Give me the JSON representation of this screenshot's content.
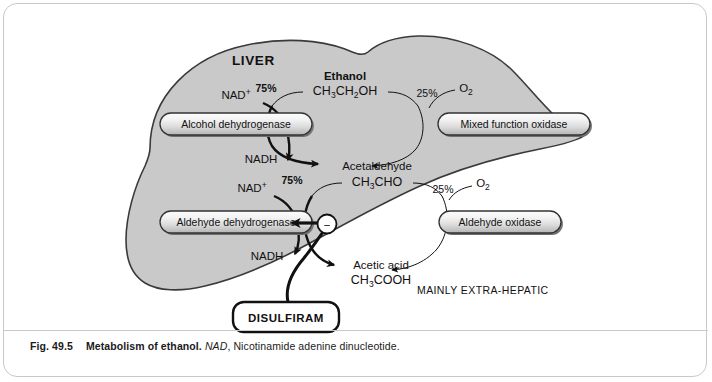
{
  "figure": {
    "organ_label": "LIVER",
    "extra_hepatic_label": "MAINLY EXTRA-HEPATIC",
    "drug_label": "DISULFIRAM",
    "colors": {
      "liver_fill": "#c9c9c9",
      "liver_stroke": "#3a3a3a",
      "pill_stroke": "#333333",
      "frame_border": "#c9c9c9",
      "text": "#111111"
    },
    "metabolites": [
      {
        "name": "Ethanol",
        "formula_main": "CH",
        "formula": "CH3CH2OH",
        "formula_parts": [
          {
            "t": "CH",
            "sub": false
          },
          {
            "t": "3",
            "sub": true
          },
          {
            "t": "CH",
            "sub": false
          },
          {
            "t": "2",
            "sub": true
          },
          {
            "t": "OH",
            "sub": false
          }
        ]
      },
      {
        "name": "Acetaldehyde",
        "formula": "CH3CHO",
        "formula_parts": [
          {
            "t": "CH",
            "sub": false
          },
          {
            "t": "3",
            "sub": true
          },
          {
            "t": "CHO",
            "sub": false
          }
        ]
      },
      {
        "name": "Acetic acid",
        "formula": "CH3COOH",
        "formula_parts": [
          {
            "t": "CH",
            "sub": false
          },
          {
            "t": "3",
            "sub": true
          },
          {
            "t": "COOH",
            "sub": false
          }
        ]
      }
    ],
    "enzymes": [
      {
        "id": "alcohol-dehydrogenase",
        "label": "Alcohol dehydrogenase"
      },
      {
        "id": "mixed-function-oxidase",
        "label": "Mixed function oxidase"
      },
      {
        "id": "aldehyde-dehydrogenase",
        "label": "Aldehyde dehydrogenase"
      },
      {
        "id": "aldehyde-oxidase",
        "label": "Aldehyde oxidase"
      }
    ],
    "cofactors": {
      "nad_plus_top": "NAD",
      "nad_plus_bottom": "NAD",
      "nad_superscript": "+",
      "nadh_top": "NADH",
      "nadh_bottom": "NADH",
      "o2_top": "O",
      "o2_bottom": "O",
      "o2_subscript": "2"
    },
    "percentages": {
      "ethanol_adh": "75%",
      "ethanol_mfo": "25%",
      "acetaldehyde_aldh": "75%",
      "acetaldehyde_ao": "25%"
    },
    "inhibition_symbol": "−"
  },
  "caption": {
    "number": "Fig. 49.5",
    "title": "Metabolism of ethanol.",
    "abbrev": "NAD",
    "expansion": ", Nicotinamide adenine dinucleotide."
  }
}
